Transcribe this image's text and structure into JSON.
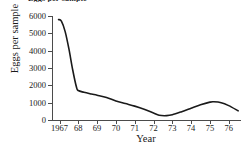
{
  "figure": {
    "clipped_title": "Eggs per sample",
    "background_color": "#ffffff",
    "line_color": "#1a1a1a",
    "axis_color": "#4b4b4b"
  },
  "chart_data": {
    "type": "line",
    "title": "",
    "xlabel": "Year",
    "ylabel": "Eggs per sample",
    "xlim": [
      1966.6,
      1976.6
    ],
    "ylim": [
      0,
      6000
    ],
    "grid": false,
    "legend": null,
    "xticks": [
      1967,
      1968,
      1969,
      1970,
      1971,
      1972,
      1973,
      1974,
      1975,
      1976
    ],
    "xtick_labels": [
      "1967",
      "68",
      "69",
      "70",
      "71",
      "72",
      "73",
      "74",
      "75",
      "76"
    ],
    "yticks": [
      0,
      1000,
      2000,
      3000,
      4000,
      5000,
      6000
    ],
    "ytick_labels": [
      "0",
      "1000",
      "2000",
      "3000",
      "4000",
      "5000",
      "6000"
    ],
    "series": [
      {
        "name": "Eggs per sample",
        "color": "#1a1a1a",
        "x": [
          1966.95,
          1967.1,
          1967.3,
          1967.5,
          1967.7,
          1967.9,
          1968.0,
          1968.3,
          1968.7,
          1969.0,
          1969.5,
          1970.0,
          1970.5,
          1971.0,
          1971.5,
          1972.0,
          1972.3,
          1972.7,
          1973.0,
          1973.5,
          1974.0,
          1974.5,
          1975.0,
          1975.2,
          1975.6,
          1976.0,
          1976.5
        ],
        "y": [
          5800,
          5700,
          5100,
          4100,
          2900,
          1900,
          1700,
          1600,
          1500,
          1430,
          1300,
          1100,
          950,
          800,
          620,
          400,
          270,
          250,
          300,
          480,
          680,
          880,
          1030,
          1050,
          1000,
          830,
          530
        ]
      }
    ]
  }
}
